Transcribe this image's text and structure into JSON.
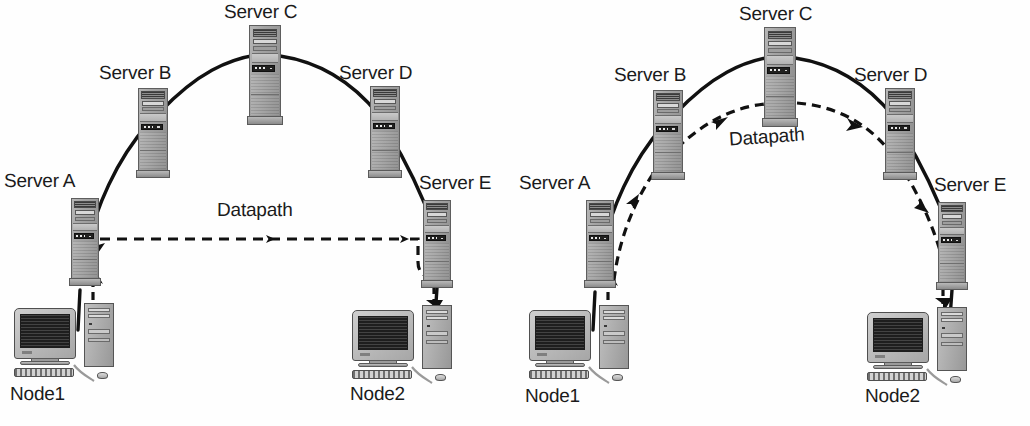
{
  "figure": {
    "type": "network-topology-diagram",
    "panel_count": 2,
    "background_color": "#ffffff",
    "line_color": "#111111"
  },
  "panels": [
    {
      "id": "left",
      "caption": "",
      "datapath_label": "Datapath",
      "datapath_style": "straight-horizontal-dashed",
      "nodes": [
        {
          "id": "node1",
          "label": "Node1",
          "type": "desktop-computer"
        },
        {
          "id": "node2",
          "label": "Node2",
          "type": "desktop-computer"
        }
      ],
      "servers": [
        {
          "id": "a",
          "label": "Server A",
          "type": "server-tower"
        },
        {
          "id": "b",
          "label": "Server B",
          "type": "server-tower"
        },
        {
          "id": "c",
          "label": "Server C",
          "type": "server-tower"
        },
        {
          "id": "d",
          "label": "Server D",
          "type": "server-tower"
        },
        {
          "id": "e",
          "label": "Server E",
          "type": "server-tower"
        }
      ],
      "solid_path": "Node1 - Server A - Server B - Server C - Server D - Server E - Node2",
      "dashed_path": "Node1 - Server A - (direct horizontal) - Server E - Node2",
      "arrow_count": 4
    },
    {
      "id": "right",
      "caption": "",
      "datapath_label": "Datapath",
      "datapath_style": "arc-following-servers-dashed",
      "nodes": [
        {
          "id": "node1",
          "label": "Node1",
          "type": "desktop-computer"
        },
        {
          "id": "node2",
          "label": "Node2",
          "type": "desktop-computer"
        }
      ],
      "servers": [
        {
          "id": "a",
          "label": "Server A",
          "type": "server-tower"
        },
        {
          "id": "b",
          "label": "Server B",
          "type": "server-tower"
        },
        {
          "id": "c",
          "label": "Server C",
          "type": "server-tower"
        },
        {
          "id": "d",
          "label": "Server D",
          "type": "server-tower"
        },
        {
          "id": "e",
          "label": "Server E",
          "type": "server-tower"
        }
      ],
      "solid_path": "Node1 - Server A - Server B - Server C - Server D - Server E - Node2",
      "dashed_path": "Node1 - Server A - Server B - Server C - Server D - Server E - Node2",
      "arrow_count": 5
    }
  ]
}
